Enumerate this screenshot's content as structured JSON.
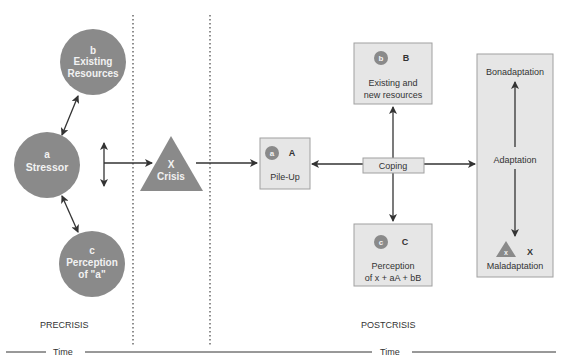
{
  "colors": {
    "node_fill": "#8a8a8a",
    "box_fill": "#e6e6e6",
    "box_stroke": "#a0a0a0",
    "line": "#333333"
  },
  "precrisis": {
    "stressor": {
      "letter": "a",
      "label": "Stressor"
    },
    "resources": {
      "letter": "b",
      "line1": "Existing",
      "line2": "Resources"
    },
    "perception": {
      "letter": "c",
      "line1": "Perception",
      "line2": "of \"a\""
    },
    "crisis": {
      "letter": "X",
      "label": "Crisis"
    },
    "phase_label": "PRECRISIS"
  },
  "postcrisis": {
    "pileup": {
      "badge": "a",
      "letter": "A",
      "label": "Pile-Up"
    },
    "resources": {
      "badge": "b",
      "letter": "B",
      "line1": "Existing and",
      "line2": "new resources"
    },
    "perception": {
      "badge": "c",
      "letter": "C",
      "line1": "Perception",
      "line2": "of x + aA + bB"
    },
    "coping": "Coping",
    "adaptation": {
      "top": "Bonadaptation",
      "middle": "Adaptation",
      "bottom": "Maladaptation",
      "badge": "x",
      "letter": "X"
    },
    "phase_label": "POSTCRISIS"
  },
  "timeline": {
    "left_label": "Time",
    "right_label": "Time"
  }
}
